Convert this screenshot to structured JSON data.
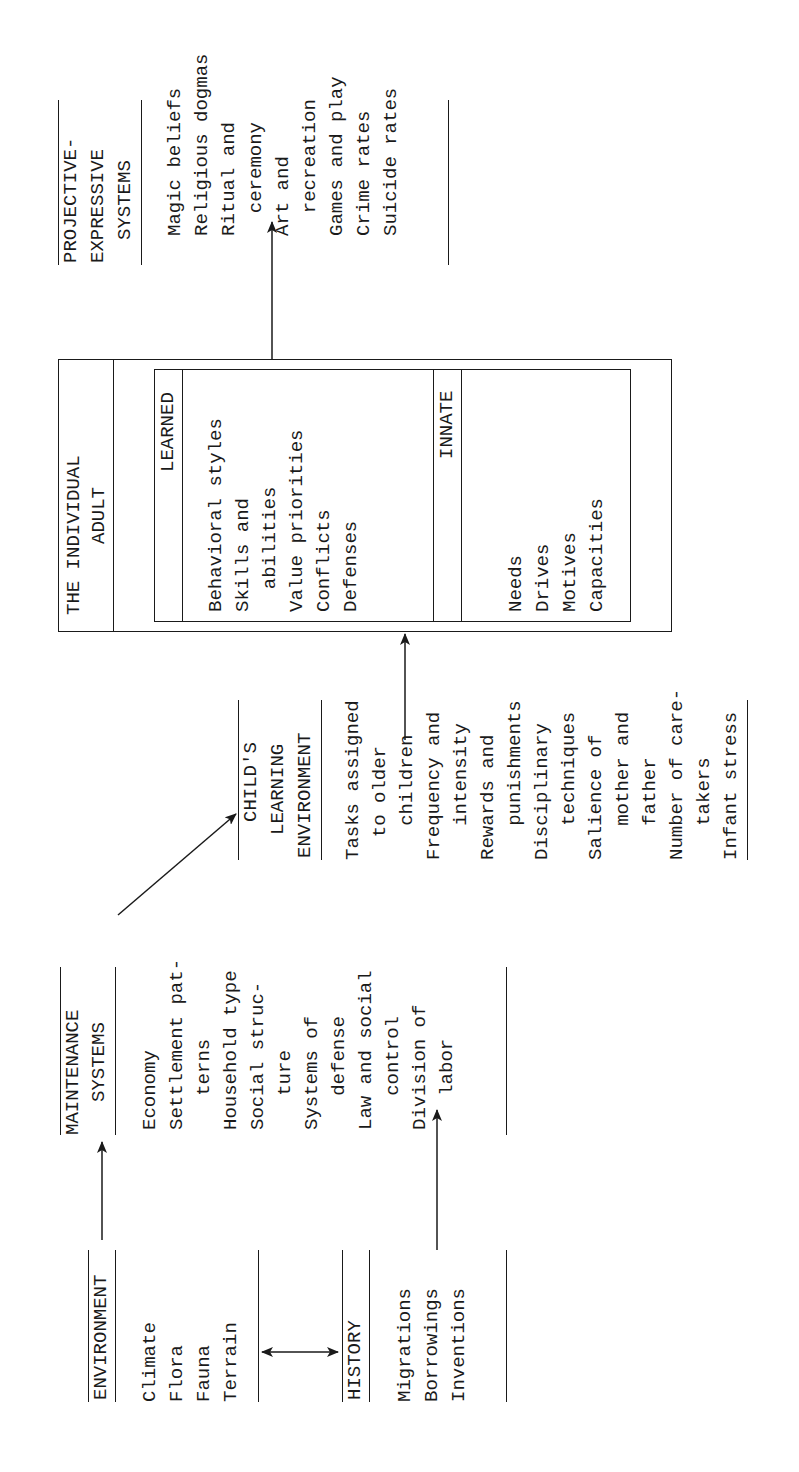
{
  "environment": {
    "title": "ENVIRONMENT",
    "items": [
      "Climate",
      "Flora",
      "Fauna",
      "Terrain"
    ]
  },
  "history": {
    "title": "HISTORY",
    "items": [
      "Migrations",
      "Borrowings",
      "Inventions"
    ]
  },
  "maintenance": {
    "title_line1": "MAINTENANCE",
    "title_line2": "SYSTEMS",
    "items": [
      "Economy",
      "Settlement pat-",
      "   terns",
      "Household type",
      "Social struc-",
      "   ture",
      "Systems of",
      "   defense",
      "Law and social",
      "   control",
      "Division of",
      "   labor"
    ]
  },
  "child_learning": {
    "title_line1": "CHILD'S",
    "title_line2": "LEARNING",
    "title_line3": "ENVIRONMENT",
    "items": [
      "Tasks assigned",
      "  to older",
      "   children",
      "Frequency and",
      "   intensity",
      "Rewards and",
      "   punishments",
      "Disciplinary",
      "   techniques",
      "Salience of",
      "   mother and",
      "   father",
      "Number of care-",
      "   takers",
      "Infant stress"
    ]
  },
  "individual_adult": {
    "title_line1": "THE INDIVIDUAL",
    "title_line2": "ADULT",
    "learned": {
      "title": "LEARNED",
      "items": [
        "Behavioral styles",
        "Skills and",
        "  abilities",
        "Value priorities",
        "Conflicts",
        "Defenses"
      ]
    },
    "innate": {
      "title": "INNATE",
      "items": [
        "Needs",
        "Drives",
        "Motives",
        "Capacities"
      ]
    }
  },
  "projective": {
    "title_line1": "PROJECTIVE-",
    "title_line2": "EXPRESSIVE",
    "title_line3": "SYSTEMS",
    "items": [
      "Magic beliefs",
      "Religious dogmas",
      "Ritual and",
      "  ceremony",
      "Art and",
      "  recreation",
      "Games and play",
      "Crime rates",
      "Suicide rates"
    ]
  }
}
